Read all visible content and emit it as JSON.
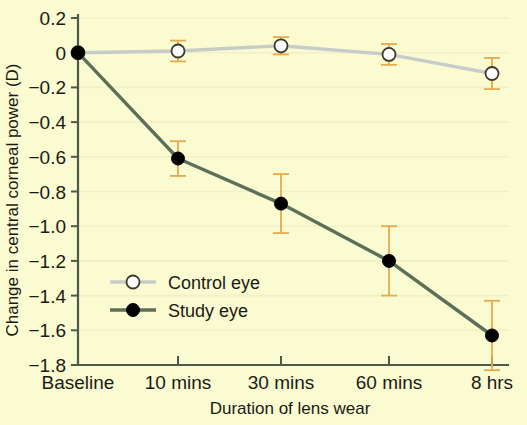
{
  "chart_data": {
    "type": "line",
    "title": "",
    "xlabel": "Duration of lens wear",
    "ylabel": "Change in central corneal power (D)",
    "categories": [
      "Baseline",
      "10 mins",
      "30 mins",
      "60 mins",
      "8 hrs"
    ],
    "ylim": [
      -1.8,
      0.2
    ],
    "ytick_labels": [
      "0.2",
      "0",
      "−0.2",
      "−0.4",
      "−0.6",
      "−0.8",
      "−1.0",
      "−1.2",
      "−1.4",
      "−1.6",
      "−1.8"
    ],
    "ytick_values": [
      0.2,
      0,
      -0.2,
      -0.4,
      -0.6,
      -0.8,
      -1.0,
      -1.2,
      -1.4,
      -1.6,
      -1.8
    ],
    "grid": true,
    "legend_position": "center-left",
    "series": [
      {
        "name": "Control eye",
        "marker": "open-circle",
        "color": "#c8ccc8",
        "values": [
          0.0,
          0.01,
          0.04,
          -0.01,
          -0.12
        ],
        "errors": [
          0.0,
          0.06,
          0.05,
          0.06,
          0.09
        ]
      },
      {
        "name": "Study eye",
        "marker": "filled-circle",
        "color": "#5c7059",
        "values": [
          0.0,
          -0.61,
          -0.87,
          -1.2,
          -1.63
        ],
        "errors": [
          0.0,
          0.1,
          0.17,
          0.2,
          0.2
        ]
      }
    ],
    "colors": {
      "background": "#fbfbd2",
      "axis": "#4d5a4a",
      "grid": "#f2f0c8",
      "error_bar": "#e8a84c",
      "control_line": "#c8ccc8",
      "study_line": "#5c7059",
      "text": "#1a1a14"
    }
  },
  "legend": {
    "items": [
      {
        "label": "Control eye"
      },
      {
        "label": "Study eye"
      }
    ]
  }
}
